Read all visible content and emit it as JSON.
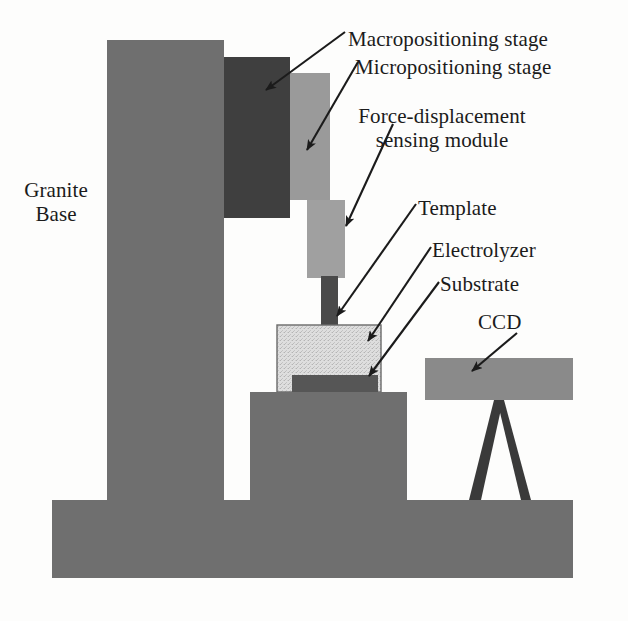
{
  "figure": {
    "kind": "technical-schematic",
    "background_color": "#fdfdfc",
    "ink_color": "#1b1b1b"
  },
  "labels": {
    "granite_base": "Granite\nBase",
    "granite_base_line1": "Granite",
    "granite_base_line2": "Base",
    "macropositioning_stage": "Macropositioning stage",
    "micropositioning_stage": "Micropositioning stage",
    "force_module_line1": "Force-displacement",
    "force_module_line2": "sensing module",
    "force_module": "Force-displacement sensing module",
    "template": "Template",
    "electrolyzer": "Electrolyzer",
    "substrate": "Substrate",
    "ccd": "CCD"
  },
  "colors": {
    "granite": "#6f6f6f",
    "macro_stage": "#3f3f3f",
    "micro_stage": "#9a9a9a",
    "force_module": "#a0a0a0",
    "template_probe": "#4a4a4a",
    "electrolyzer_fill": "#dedede",
    "electrolyzer_stroke": "#6a6a6a",
    "substrate": "#565656",
    "pedestal": "#6f6f6f",
    "base_plate": "#6f6f6f",
    "ccd_body": "#8a8a8a",
    "ccd_stand": "#3a3a3a",
    "arrow": "#1b1b1b"
  },
  "parts": [
    {
      "id": "granite-column",
      "name": "Granite Base column",
      "shade": "medium-gray",
      "x": 107,
      "y": 40,
      "w": 117,
      "h": 460
    },
    {
      "id": "granite-base-plate",
      "name": "Granite base plate",
      "shade": "medium-gray",
      "x": 52,
      "y": 500,
      "w": 521,
      "h": 78
    },
    {
      "id": "macropositioning-stage",
      "name": "Macropositioning stage",
      "shade": "dark-gray",
      "x": 224,
      "y": 57,
      "w": 66,
      "h": 161
    },
    {
      "id": "micropositioning-stage",
      "name": "Micropositioning stage",
      "shade": "light-medium-gray",
      "x": 290,
      "y": 73,
      "w": 40,
      "h": 127
    },
    {
      "id": "force-sensing-module",
      "name": "Force-displacement sensing module",
      "shade": "light-medium-gray",
      "x": 307,
      "y": 200,
      "w": 38,
      "h": 78
    },
    {
      "id": "template-probe",
      "name": "Template probe",
      "shade": "dark-gray",
      "x": 321,
      "y": 278,
      "w": 17,
      "h": 82
    },
    {
      "id": "electrolyzer-vessel",
      "name": "Electrolyzer vessel",
      "shade": "speckled-light",
      "x": 277,
      "y": 325,
      "w": 104,
      "h": 67
    },
    {
      "id": "substrate-plate",
      "name": "Substrate",
      "shade": "dark-gray",
      "x": 292,
      "y": 375,
      "w": 86,
      "h": 17
    },
    {
      "id": "specimen-pedestal",
      "name": "Specimen pedestal stage",
      "shade": "medium-gray",
      "x": 250,
      "y": 392,
      "w": 157,
      "h": 108
    },
    {
      "id": "ccd-body",
      "name": "CCD camera body",
      "shade": "light-medium-gray",
      "x": 425,
      "y": 358,
      "w": 148,
      "h": 42
    },
    {
      "id": "ccd-stand",
      "name": "CCD tripod stand",
      "shade": "dark-gray",
      "x": 470,
      "y": 400,
      "w": 60,
      "h": 100
    }
  ],
  "leader_arrows": [
    {
      "id": "arrow-macropositioning",
      "target": "macropositioning-stage",
      "from_x": 345,
      "from_y": 32,
      "to_x": 263,
      "to_y": 92
    },
    {
      "id": "arrow-micropositioning",
      "target": "micropositioning-stage",
      "from_x": 355,
      "from_y": 63,
      "to_x": 305,
      "to_y": 152
    },
    {
      "id": "arrow-force-module",
      "target": "force-sensing-module",
      "from_x": 392,
      "from_y": 123,
      "to_x": 344,
      "to_y": 228
    },
    {
      "id": "arrow-template",
      "target": "template-probe",
      "from_x": 415,
      "from_y": 203,
      "to_x": 334,
      "to_y": 318
    },
    {
      "id": "arrow-electrolyzer",
      "target": "electrolyzer-vessel",
      "from_x": 430,
      "from_y": 246,
      "to_x": 366,
      "to_y": 343
    },
    {
      "id": "arrow-substrate",
      "target": "substrate-plate",
      "from_x": 438,
      "from_y": 281,
      "to_x": 367,
      "to_y": 377
    },
    {
      "id": "arrow-ccd",
      "target": "ccd-body",
      "from_x": 515,
      "from_y": 332,
      "to_x": 470,
      "to_y": 372
    }
  ]
}
